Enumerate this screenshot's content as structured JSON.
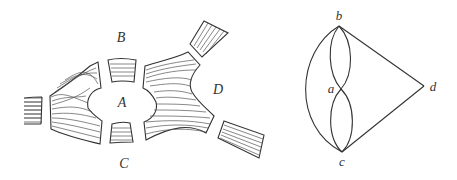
{
  "figure": {
    "left_panel": {
      "description": "Sketch of the Königsberg river with land masses and seven bridges",
      "land_labels": [
        {
          "id": "A",
          "text": "A",
          "x": 122,
          "y": 103
        },
        {
          "id": "B",
          "text": "B",
          "x": 121,
          "y": 38
        },
        {
          "id": "C",
          "text": "C",
          "x": 124,
          "y": 164
        },
        {
          "id": "D",
          "text": "D",
          "x": 218,
          "y": 90
        }
      ]
    },
    "right_panel": {
      "description": "Multigraph representing the Königsberg bridges",
      "nodes": [
        {
          "id": "a",
          "text": "a",
          "x": 341,
          "y": 89,
          "label_x": 331,
          "label_y": 88
        },
        {
          "id": "b",
          "text": "b",
          "x": 339,
          "y": 26,
          "label_x": 339,
          "label_y": 15
        },
        {
          "id": "c",
          "text": "c",
          "x": 342,
          "y": 152,
          "label_x": 342,
          "label_y": 161
        },
        {
          "id": "d",
          "text": "d",
          "x": 424,
          "y": 86,
          "label_x": 433,
          "label_y": 86
        }
      ],
      "edges": [
        {
          "from": "a",
          "to": "b",
          "count": 2
        },
        {
          "from": "a",
          "to": "c",
          "count": 2
        },
        {
          "from": "b",
          "to": "c",
          "count": 1
        },
        {
          "from": "b",
          "to": "d",
          "count": 1
        },
        {
          "from": "c",
          "to": "d",
          "count": 1
        }
      ]
    },
    "colors": {
      "ink": "#333333",
      "hatch": "#555555",
      "background": "#ffffff"
    }
  }
}
